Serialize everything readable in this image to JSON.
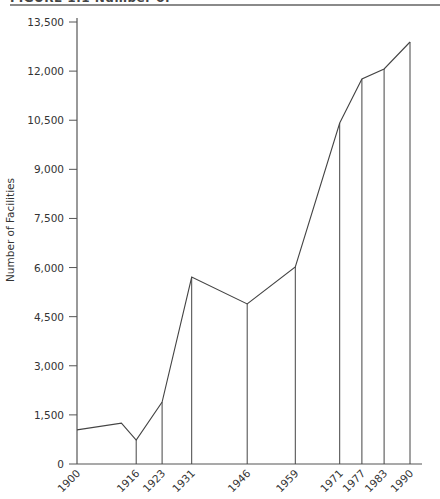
{
  "figure": {
    "title_clipped": "FIGURE 1.1 Number of"
  },
  "chart_data": {
    "type": "line",
    "title": "",
    "xlabel": "",
    "ylabel": "Number of Facilities",
    "ylim": [
      0,
      13500
    ],
    "yticks": [
      0,
      1500,
      3000,
      4500,
      6000,
      7500,
      9000,
      10500,
      12000,
      13500
    ],
    "ytick_labels": [
      "0",
      "1,500",
      "3,000",
      "4,500",
      "6,000",
      "7,500",
      "9,000",
      "10,500",
      "12,000",
      "13,500"
    ],
    "xlim": [
      1900,
      1993
    ],
    "xtick_labels": [
      "1900",
      "1916",
      "1923",
      "1931",
      "1946",
      "1959",
      "1971",
      "1977",
      "1983",
      "1990"
    ],
    "grid": false,
    "legend": null,
    "drop_lines": true,
    "points": [
      {
        "x": 1900,
        "y": 1040,
        "label": "1900"
      },
      {
        "x": 1912,
        "y": 1250,
        "label": ""
      },
      {
        "x": 1916,
        "y": 730,
        "label": "1916"
      },
      {
        "x": 1923,
        "y": 1890,
        "label": "1923"
      },
      {
        "x": 1931,
        "y": 5710,
        "label": "1931"
      },
      {
        "x": 1946,
        "y": 4890,
        "label": "1946"
      },
      {
        "x": 1959,
        "y": 6020,
        "label": "1959"
      },
      {
        "x": 1971,
        "y": 10415,
        "label": "1971"
      },
      {
        "x": 1977,
        "y": 11760,
        "label": "1977"
      },
      {
        "x": 1983,
        "y": 12065,
        "label": "1983"
      },
      {
        "x": 1990,
        "y": 12890,
        "label": "1990"
      }
    ],
    "colors": {
      "line": "#444444",
      "axis": "#555555",
      "text": "#333333"
    }
  }
}
